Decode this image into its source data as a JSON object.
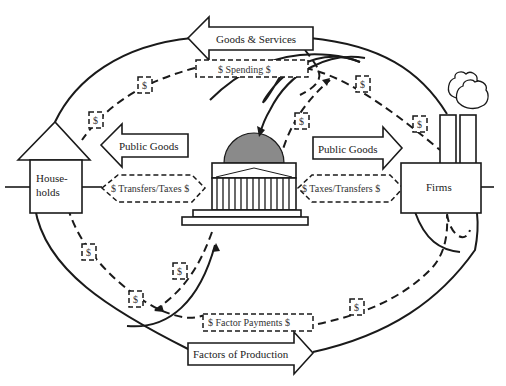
{
  "diagram": {
    "nodes": {
      "households": {
        "label_line1": "House-",
        "label_line2": "holds"
      },
      "firms": {
        "label": "Firms"
      },
      "government": {
        "label": ""
      }
    },
    "arrows": {
      "goods_services": "Goods & Services",
      "spending": "$ Spending $",
      "public_goods_left": "Public Goods",
      "public_goods_right": "Public Goods",
      "transfers_taxes": "$ Transfers/Taxes $",
      "taxes_transfers": "$ Taxes/Transfers $",
      "factor_payments": "$ Factor Payments $",
      "factors_of_production": "Factors of Production"
    },
    "dollar_tokens": [
      "$",
      "$",
      "$",
      "$",
      "$",
      "$",
      "$",
      "$",
      "$"
    ],
    "colors": {
      "line": "#1a1a1a",
      "dome": "#8a8a8a",
      "background": "#ffffff"
    }
  }
}
